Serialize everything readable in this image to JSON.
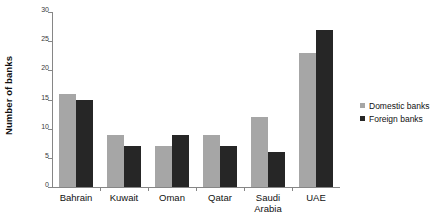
{
  "chart_data": {
    "type": "bar",
    "title": "",
    "xlabel": "",
    "ylabel": "Number of banks",
    "ylim": [
      0,
      30
    ],
    "ytick_values": [
      0,
      5,
      10,
      15,
      20,
      25,
      30
    ],
    "ytick_labels": [
      "0",
      "5",
      "10",
      "15",
      "20",
      "25",
      "30"
    ],
    "grid": false,
    "legend_position": "right",
    "categories": [
      "Bahrain",
      "Kuwait",
      "Oman",
      "Qatar",
      "Saudi Arabia",
      "UAE"
    ],
    "series": [
      {
        "name": "Domestic banks",
        "color": "#a6a6a6",
        "values": [
          16,
          9,
          7,
          9,
          12,
          23
        ]
      },
      {
        "name": "Foreign banks",
        "color": "#262626",
        "values": [
          15,
          7,
          9,
          7,
          6,
          27
        ]
      }
    ]
  },
  "legend": {
    "items": [
      {
        "label": "Domestic banks"
      },
      {
        "label": "Foreign banks"
      }
    ]
  },
  "colors": {
    "domestic": "#a6a6a6",
    "foreign": "#262626",
    "axis": "#868686",
    "background": "#ffffff"
  }
}
